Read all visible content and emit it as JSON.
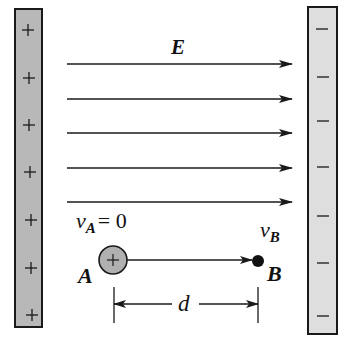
{
  "diagram": {
    "colors": {
      "positive_plate": "#b8b8b8",
      "negative_plate": "#dedede",
      "stroke": "#1a1a1a",
      "charge_fill": "#b0b0b0"
    },
    "left_plate": {
      "sign": "+",
      "sign_count": 7
    },
    "right_plate": {
      "sign": "−",
      "sign_count": 7
    },
    "field": {
      "label": "E",
      "arrow_count": 5
    },
    "point_a": {
      "label": "A",
      "charge_sign": "+",
      "velocity_symbol": "v",
      "velocity_sub": "A",
      "velocity_value": "= 0"
    },
    "point_b": {
      "label": "B",
      "velocity_symbol": "v",
      "velocity_sub": "B"
    },
    "distance": {
      "label": "d"
    }
  }
}
